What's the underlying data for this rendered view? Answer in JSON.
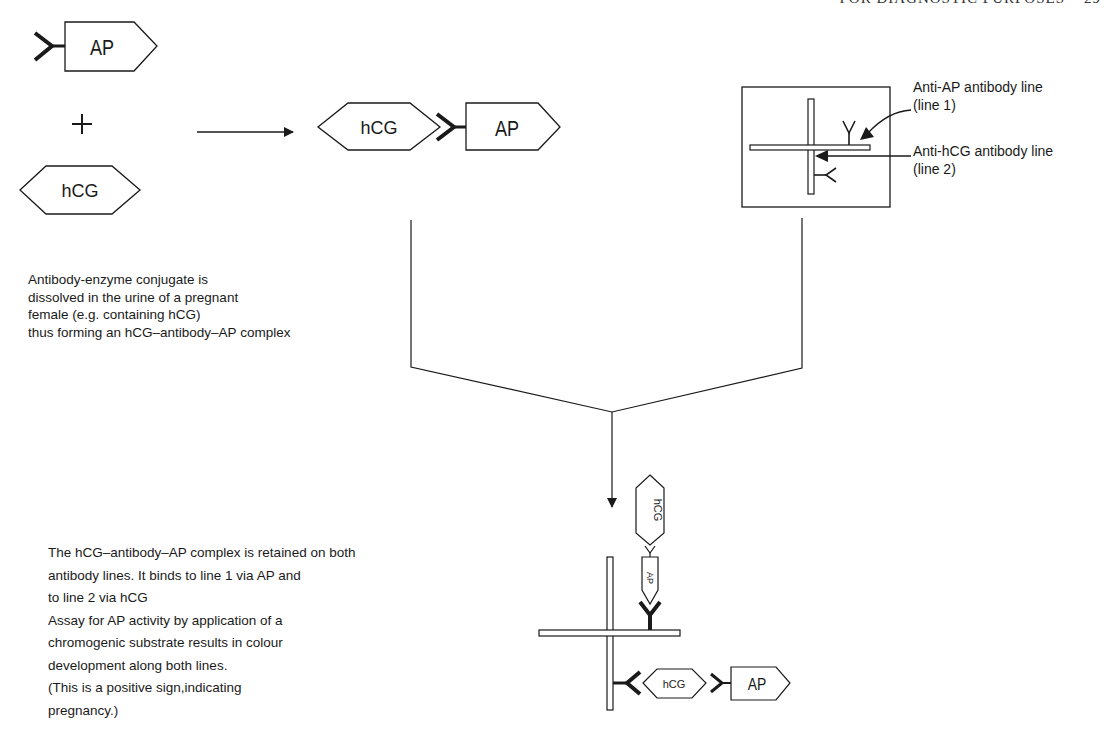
{
  "header": {
    "running_title": "FOR DIAGNOSTIC PURPOSES",
    "page_number": "29"
  },
  "molecules": {
    "ap": "AP",
    "hcg": "hCG",
    "plus": "+"
  },
  "test_strip": {
    "line1_label": "Anti-AP antibody line",
    "line1_sub": "(line 1)",
    "line2_label": "Anti-hCG antibody line",
    "line2_sub": "(line 2)"
  },
  "step1": {
    "lines": [
      "Antibody-enzyme conjugate is",
      "dissolved in the urine of a pregnant",
      "female (e.g. containing hCG)",
      "thus forming an hCG–antibody–AP complex"
    ]
  },
  "step2": {
    "lines": [
      "The hCG–antibody–AP complex is retained on both",
      "antibody lines. It binds to line 1 via AP and",
      "to line 2 via hCG",
      "Assay for AP activity by application of a",
      "chromogenic substrate results in colour",
      "development along both lines.",
      "(This is a positive sign,indicating",
      "pregnancy.)"
    ]
  },
  "colors": {
    "ink": "#1a1a1a",
    "background": "#ffffff"
  }
}
